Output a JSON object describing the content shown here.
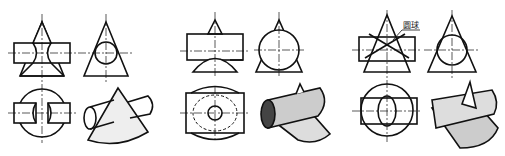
{
  "figure": {
    "panels": [
      {
        "id": "a",
        "description": "cylinder penetrating cone, smaller cylinder"
      },
      {
        "id": "b",
        "description": "large cylinder intersecting cone apex"
      },
      {
        "id": "c",
        "description": "cylinder and cone sharing common inscribed sphere"
      }
    ],
    "annotation": {
      "text": "圆球"
    },
    "colors": {
      "line": "#111111",
      "background": "#ffffff"
    }
  }
}
